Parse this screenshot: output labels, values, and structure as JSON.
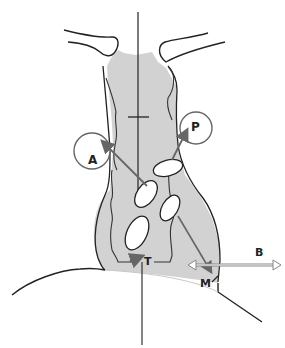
{
  "labels": {
    "A": "A",
    "P": "P",
    "T": "T",
    "M": "M",
    "B": "B"
  },
  "colors": {
    "fill": "#d2d2d2",
    "stroke": "#222222",
    "arrow": "#666666",
    "background": "#ffffff"
  }
}
